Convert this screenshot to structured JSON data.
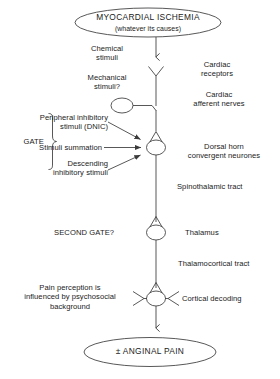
{
  "diagram": {
    "title_node": {
      "line1": "MYOCARDIAL ISCHEMIA",
      "line2": "(whatever its causes)"
    },
    "outcome_node": {
      "label": "± ANGINAL PAIN"
    },
    "left_labels": {
      "chemical_stimuli": "Chemical\nstimuli",
      "mechanical_stimuli": "Mechanical\nstimuli?",
      "gate": "GATE",
      "peripheral_inhibitory": "Peripheral inhibitory\nstimuli (DNIC)",
      "stimuli_summation": "Stimuli summation",
      "descending_inhibitory": "Descending\ninhibitory stimuli",
      "second_gate": "SECOND GATE?",
      "pain_perception": "Pain perception is\ninfluenced by psychosocial\nbackground"
    },
    "right_labels": {
      "cardiac_receptors": "Cardiac\nreceptors",
      "cardiac_afferent_nerves": "Cardiac\nafferent nerves",
      "dorsal_horn": "Dorsal horn\nconvergent neurones",
      "spinothalamic_tract": "Spinothalamic tract",
      "thalamus": "Thalamus",
      "thalamocortical_tract": "Thalamocortical tract",
      "cortical_decoding": "Cortical decoding"
    },
    "colors": {
      "stroke": "#3a3a3a",
      "text": "#1a1a1a",
      "background": "#ffffff"
    }
  }
}
